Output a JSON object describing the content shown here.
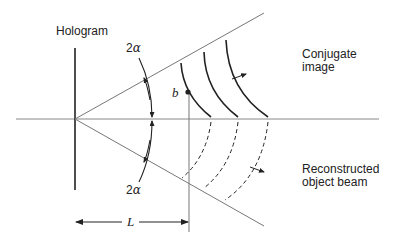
{
  "labels": {
    "hologram": "Hologram",
    "conjugate_line1": "Conjugate",
    "conjugate_line2": "image",
    "reconstructed_line1": "Reconstructed",
    "reconstructed_line2": "object beam",
    "angle_upper_num": "2",
    "angle_upper_sym": "α",
    "angle_lower_num": "2",
    "angle_lower_sym": "α",
    "point": "b",
    "distance": "L"
  },
  "colors": {
    "ink": "#222222",
    "thin_line": "#777777",
    "background": "#ffffff"
  },
  "geometry": {
    "axis_y": 119,
    "hologram_x": 75,
    "plane_x": 189,
    "cone_apex": [
      75,
      119
    ],
    "cone_upper_end": [
      264,
      13
    ],
    "cone_lower_end": [
      264,
      226
    ]
  }
}
